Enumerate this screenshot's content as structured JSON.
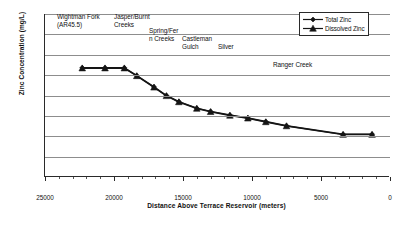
{
  "chart_data": {
    "type": "line",
    "title": "",
    "xlabel": "Distance Above Terrace Reservoir (meters)",
    "ylabel": "Zinc Concentration (mg/L)",
    "xlim": [
      25000,
      0
    ],
    "ylim": [
      0,
      0.4
    ],
    "x_reversed": true,
    "grid": "horizontal",
    "legend_position": "top-right",
    "yticks": [
      0,
      0.05,
      0.1,
      0.15,
      0.2,
      0.25,
      0.3,
      0.35,
      0.4
    ],
    "ytick_labels": [
      "0",
      "0.05",
      "0.1",
      "0.15",
      "0.2",
      "0.25",
      "0.3",
      "0.35",
      "0.4"
    ],
    "xticks": [
      25000,
      20000,
      15000,
      10000,
      5000,
      0
    ],
    "xtick_labels": [
      "25000",
      "20000",
      "15000",
      "10000",
      "5000",
      "0"
    ],
    "x_minor_step": 1000,
    "x": [
      22300,
      20650,
      19250,
      18350,
      17100,
      16200,
      15300,
      14000,
      13000,
      11600,
      10300,
      9000,
      7500,
      3400,
      1300
    ],
    "series": [
      {
        "name": "Total Zinc",
        "marker": "diamond",
        "values": [
          0.268,
          0.268,
          0.268,
          0.249,
          0.221,
          0.2,
          0.185,
          0.169,
          0.161,
          0.152,
          0.145,
          0.136,
          0.126,
          0.105,
          0.105
        ]
      },
      {
        "name": "Dissolved Zinc",
        "marker": "triangle",
        "values": [
          0.267,
          0.267,
          0.267,
          0.248,
          0.22,
          0.199,
          0.184,
          0.168,
          0.16,
          0.151,
          0.144,
          0.135,
          0.125,
          0.104,
          0.104
        ]
      }
    ],
    "annotations": [
      {
        "text": "Wightman Fork\n(AR45.5)",
        "left": 57,
        "top": 13
      },
      {
        "text": "Jasper/Burnt\nCreeks",
        "left": 114,
        "top": 13
      },
      {
        "text": "Spring/Fer\nn Creeks",
        "left": 149,
        "top": 27
      },
      {
        "text": "Castleman\nGulch",
        "left": 182,
        "top": 35
      },
      {
        "text": "Silver",
        "left": 218,
        "top": 43
      },
      {
        "text": "Ranger Creek",
        "left": 273,
        "top": 61
      }
    ]
  },
  "legend": {
    "items": [
      {
        "label": "Total Zinc",
        "marker": "diamond"
      },
      {
        "label": "Dissolved Zinc",
        "marker": "triangle"
      }
    ]
  }
}
